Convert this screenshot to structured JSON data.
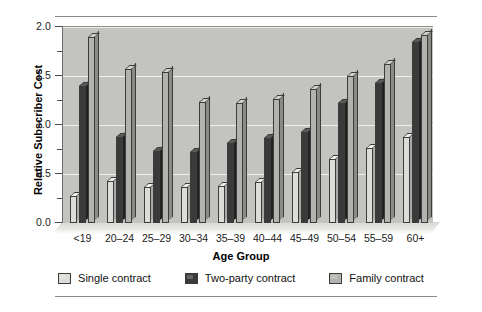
{
  "chart_data": {
    "type": "bar",
    "title": "",
    "xlabel": "Age Group",
    "ylabel": "Relative Subscriber Cost",
    "categories": [
      "<19",
      "20–24",
      "25–29",
      "30–34",
      "35–39",
      "40–44",
      "45–49",
      "50–54",
      "55–59",
      "60+"
    ],
    "series": [
      {
        "name": "Single contract",
        "color": "#dcdcd8",
        "values": [
          0.28,
          0.43,
          0.37,
          0.37,
          0.38,
          0.42,
          0.52,
          0.65,
          0.77,
          0.88
        ]
      },
      {
        "name": "Two-party contract",
        "color": "#3a3a3a",
        "values": [
          1.4,
          0.88,
          0.73,
          0.72,
          0.82,
          0.87,
          0.93,
          1.22,
          1.43,
          1.85
        ]
      },
      {
        "name": "Family contract",
        "color": "#b2b2ae",
        "values": [
          1.9,
          1.57,
          1.54,
          1.23,
          1.22,
          1.27,
          1.37,
          1.5,
          1.62,
          1.92
        ]
      }
    ],
    "ylim": [
      0.0,
      2.0
    ],
    "ytick_labels": [
      "0.0",
      "0.5",
      "1.0",
      "1.5",
      "2.0"
    ],
    "ytick_values": [
      0.0,
      0.5,
      1.0,
      1.5,
      2.0
    ],
    "yminor_tick_values": [
      0.25,
      0.75,
      1.25,
      1.75
    ],
    "grid": true,
    "grid_axis": "y",
    "legend_position": "bottom",
    "plot_background": "#c3c3c0",
    "gridline_color": "#efefed",
    "three_d": true
  },
  "legend": {
    "items": [
      {
        "label": "Single contract"
      },
      {
        "label": "Two-party contract"
      },
      {
        "label": "Family contract"
      }
    ]
  }
}
